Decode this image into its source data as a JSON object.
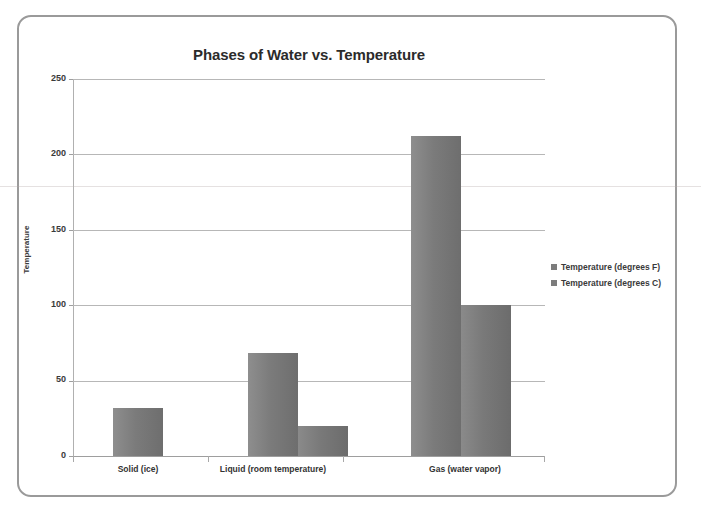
{
  "chart_data": {
    "type": "bar",
    "title": "Phases of Water vs. Temperature",
    "xlabel": "",
    "ylabel": "Temperature",
    "categories": [
      "Solid (ice)",
      "Liquid (room temperature)",
      "Gas (water vapor)"
    ],
    "series": [
      {
        "name": "Temperature (degrees F)",
        "color": "#7b7b7b",
        "values": [
          32,
          68,
          212
        ]
      },
      {
        "name": "Temperature (degrees C)",
        "color": "#797979",
        "values": [
          null,
          20,
          100
        ]
      }
    ],
    "ylim": [
      0,
      250
    ],
    "yticks": [
      "0",
      "50",
      "100",
      "150",
      "200",
      "250"
    ],
    "grid": true,
    "legend_position": "right"
  },
  "legend": {
    "items": [
      {
        "label": "Temperature (degrees F)",
        "marker": "square-marker"
      },
      {
        "label": "Temperature (degrees C)",
        "marker": "square-marker"
      }
    ]
  }
}
